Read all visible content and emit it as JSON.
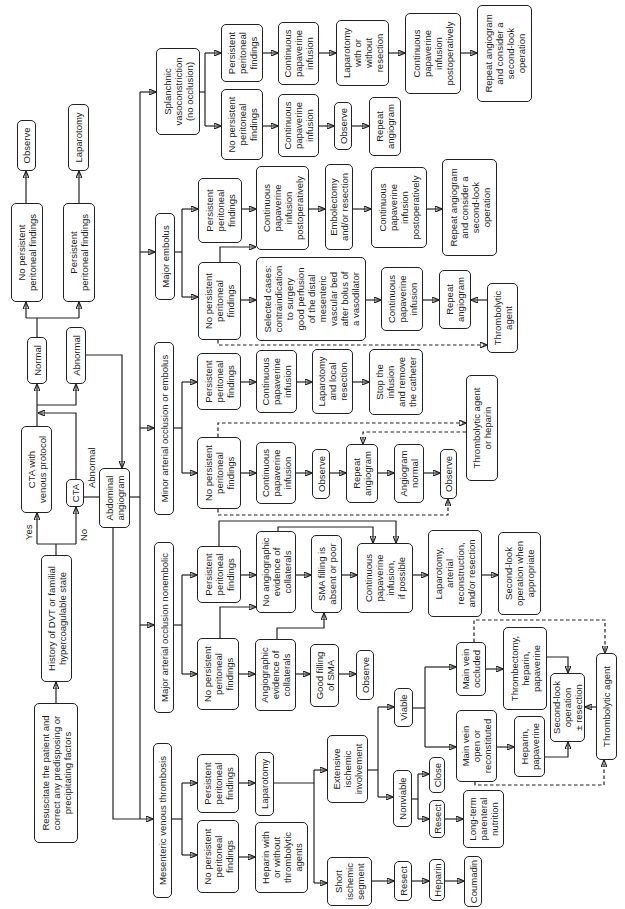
{
  "labels": {
    "yes": "Yes",
    "no": "No",
    "abnormal": "Abnormal"
  },
  "nodes": {
    "resuscitate": "Resuscitate the patient and\ncorrect any predisposing or\nprecipitating factors",
    "history": "History of DVT or familial\nhypercoagulable state",
    "cta_venous": "CTA  with\nvenous protocol",
    "cta": "CTA",
    "abd_angio": "Abdominal\nangiogram",
    "normal": "Normal",
    "abnormal": "Abnormal",
    "np_top": "No persistent\nperitoneal findings",
    "p_top": "Persistent\nperitoneal findings",
    "observe_top": "Observe",
    "laparotomy_top": "Laparotomy",
    "mvt": "Mesenteric venous thrombosis",
    "major_ne": "Major arterial occlusion nonembolic",
    "minor": "Minor arterial occlusion or embolus",
    "major_emb": "Major embolus",
    "splanchnic": "Splanchnic\nvasoconstriction\n(no occlusion)",
    "mvt_np": "No persistent\nperitoneal\nfindings",
    "mvt_p": "Persistent\nperitoneal\nfindings",
    "mvt_heparin": "Heparin with\nor without\nthrombolytic\nagents",
    "mvt_lap": "Laparotom y",
    "mvt_extensive": "Extensive\nischemic\ninvolvement",
    "mvt_short": "Short\nischemic\nsegment",
    "viable": "Viable",
    "nonviable": "Nonviable",
    "mv_occluded": "Main vein\noccluded",
    "mv_open": "Main vein\nopen or\nreconstituted",
    "thrombectomy": "Thrombectomy,\nheparin,\npapaverine",
    "heparin_pap": "Heparin,\npapaverine",
    "second_look_mvt": "Second-look\noperation\n± resection",
    "thrombolytic_mvt": "Thrombolytic agent",
    "close": "Close",
    "resect_nv": "Resect",
    "ltpn": "Long-term\nparenteral\nnutrition",
    "resect_short": "Resect",
    "heparin_short": "Heparin",
    "coumadin": "Coumadin",
    "mne_np": "No persistent\nperitoneal\nfindings",
    "mne_p": "Persistent\nperitoneal\nfindings",
    "mne_coll": "Angiographic\nevidence of\ncollaterals",
    "mne_good_sma": "Good filling\nof SMA",
    "mne_observe": "Observe",
    "mne_no_coll": "No angiographic\nevidence of\ncollaterals",
    "mne_sma_poor": "SMA filling is\nabsent or poor",
    "mne_cpi": "Continuous\npapaverine\ninfusion,\nif possible",
    "mne_lap": "Laparotomy,\narterial\nreconstruction,\nand/or resection",
    "mne_second_look": "Second-look\noperation when\nappropriate",
    "min_np": "No persistent\nperitoneal\nfindings",
    "min_p": "Persistent\nperitoneal\nfindings",
    "min_np_cpi": "Continuous\npapaverine\ninfusion",
    "min_np_observe": "Observe",
    "min_np_repeat": "Repeat\nangiogram",
    "min_np_normal": "Angiogram\nnormal",
    "min_np_observe2": "Observe",
    "min_thrombolytic": "Thrombolytic agent\nor heparin",
    "min_p_cpi": "Continuous\npapaverine\ninfusion",
    "min_p_lap": "Laparotomy\nand local\nresection",
    "min_p_stop": "Stop the\ninfusion\nand remove\nthe catheter",
    "emb_np": "No persistent\nperitoneal\nfindings",
    "emb_p": "Persistent\nperitoneal\nfindings",
    "emb_np_selected": "Selected cases:\ncontraindication\nto surgery\ngood perfusion\nof the distal\nmesenteric\nvascular bed\nafter bolus of\na vasodilator",
    "emb_np_cpi": "Continuous\npapaverine\ninfusion",
    "emb_np_repeat": "Repeat\nangiogram",
    "emb_np_thrombolytic": "Thrombolytic\nagent",
    "emb_p_cpi_postop": "Continuous\npapaverine\ninfusion\npostoperatively",
    "emb_p_embolectomy": "Embolectomy\nand/or resection",
    "emb_p_cpi_postop2": "Continuous\npapaverine\ninfusion\npostoperatively",
    "emb_p_repeat": "Repeat angiogram\nand consider a\nsecond-look\noperation",
    "spl_np": "No persistent\nperitoneal\nfindings",
    "spl_p": "Persistent\nperitoneal\nfindings",
    "spl_np_cpi": "Continuous\npapaverine\ninfusion",
    "spl_np_observe": "Observe",
    "spl_np_repeat": "Repeat\nangiogram",
    "spl_p_cpi": "Continuous\npapaverine\ninfusion",
    "spl_p_lap": "Laparotomy\nwith or\nwithout\nresection",
    "spl_p_cpi_postop": "Continuous\npapaverine\ninfusion\npostoperatively",
    "spl_p_repeat": "Repeat angiogram\nand consider a\nsecond-look\noperation"
  },
  "edges": [
    [
      "resuscitate",
      "history",
      "solid"
    ],
    [
      "history",
      "cta_venous",
      "solid",
      "Yes"
    ],
    [
      "history",
      "cta",
      "solid",
      "No"
    ],
    [
      "cta_venous",
      "normal",
      "solid"
    ],
    [
      "cta_venous",
      "abnormal",
      "solid"
    ],
    [
      "cta",
      "normal",
      "solid"
    ],
    [
      "cta",
      "abnormal",
      "solid"
    ],
    [
      "cta",
      "abd_angio",
      "solid",
      "Abnormal"
    ],
    [
      "abnormal",
      "abd_angio",
      "solid"
    ],
    [
      "normal",
      "np_top",
      "solid"
    ],
    [
      "normal",
      "p_top",
      "solid"
    ],
    [
      "np_top",
      "observe_top",
      "solid"
    ],
    [
      "p_top",
      "laparotomy_top",
      "solid"
    ],
    [
      "abd_angio",
      "mvt",
      "solid"
    ],
    [
      "abd_angio",
      "major_ne",
      "solid"
    ],
    [
      "abd_angio",
      "minor",
      "solid"
    ],
    [
      "abd_angio",
      "major_emb",
      "solid"
    ],
    [
      "abd_angio",
      "splanchnic",
      "solid"
    ],
    [
      "mvt",
      "mvt_np",
      "solid"
    ],
    [
      "mvt",
      "mvt_p",
      "solid"
    ],
    [
      "mvt_np",
      "mvt_heparin",
      "solid"
    ],
    [
      "mvt_p",
      "mvt_lap",
      "solid"
    ],
    [
      "mvt_lap",
      "mvt_extensive",
      "solid"
    ],
    [
      "mvt_lap",
      "mvt_short",
      "solid"
    ],
    [
      "mvt_extensive",
      "viable",
      "solid"
    ],
    [
      "mvt_extensive",
      "nonviable",
      "solid"
    ],
    [
      "viable",
      "mv_occluded",
      "solid"
    ],
    [
      "viable",
      "mv_open",
      "solid"
    ],
    [
      "mv_occluded",
      "thrombectomy",
      "solid"
    ],
    [
      "mv_open",
      "heparin_pap",
      "solid"
    ],
    [
      "thrombectomy",
      "second_look_mvt",
      "solid"
    ],
    [
      "heparin_pap",
      "second_look_mvt",
      "solid"
    ],
    [
      "thrombolytic_mvt",
      "second_look_mvt",
      "solid"
    ],
    [
      "mv_occluded",
      "thrombolytic_mvt",
      "dashed"
    ],
    [
      "mv_open",
      "thrombolytic_mvt",
      "dashed"
    ],
    [
      "nonviable",
      "close",
      "solid"
    ],
    [
      "nonviable",
      "resect_nv",
      "solid"
    ],
    [
      "resect_nv",
      "ltpn",
      "solid"
    ],
    [
      "mvt_short",
      "resect_short",
      "solid"
    ],
    [
      "resect_short",
      "heparin_short",
      "solid"
    ],
    [
      "heparin_short",
      "coumadin",
      "solid"
    ],
    [
      "major_ne",
      "mne_np",
      "solid"
    ],
    [
      "major_ne",
      "mne_p",
      "solid"
    ],
    [
      "mne_np",
      "mne_coll",
      "solid"
    ],
    [
      "mne_np",
      "mne_no_coll",
      "solid"
    ],
    [
      "mne_coll",
      "mne_good_sma",
      "solid"
    ],
    [
      "mne_coll",
      "mne_sma_poor",
      "solid"
    ],
    [
      "mne_good_sma",
      "mne_observe",
      "solid"
    ],
    [
      "mne_p",
      "mne_no_coll",
      "solid"
    ],
    [
      "mne_p",
      "mne_cpi",
      "solid"
    ],
    [
      "mne_no_coll",
      "mne_sma_poor",
      "solid"
    ],
    [
      "mne_no_coll",
      "mne_cpi",
      "solid"
    ],
    [
      "mne_sma_poor",
      "mne_cpi",
      "solid"
    ],
    [
      "mne_cpi",
      "mne_lap",
      "solid"
    ],
    [
      "mne_lap",
      "mne_second_look",
      "solid"
    ],
    [
      "minor",
      "min_np",
      "solid"
    ],
    [
      "minor",
      "min_p",
      "solid"
    ],
    [
      "min_np",
      "min_np_cpi",
      "solid"
    ],
    [
      "min_np_cpi",
      "min_np_observe",
      "solid"
    ],
    [
      "min_np_observe",
      "min_np_repeat",
      "solid"
    ],
    [
      "min_np_repeat",
      "min_np_normal",
      "solid"
    ],
    [
      "min_np_normal",
      "min_np_observe2",
      "solid"
    ],
    [
      "min_np",
      "min_thrombolytic",
      "dashed"
    ],
    [
      "min_thrombolytic",
      "min_np_repeat",
      "dashed"
    ],
    [
      "min_np",
      "min_np_observe2",
      "dashed"
    ],
    [
      "min_p",
      "min_p_cpi",
      "solid"
    ],
    [
      "min_p_cpi",
      "min_p_lap",
      "solid"
    ],
    [
      "min_p_lap",
      "min_p_stop",
      "solid"
    ],
    [
      "major_emb",
      "emb_np",
      "solid"
    ],
    [
      "major_emb",
      "emb_p",
      "solid"
    ],
    [
      "emb_p",
      "emb_p_cpi_postop",
      "solid"
    ],
    [
      "emb_np",
      "emb_p_cpi_postop",
      "solid"
    ],
    [
      "emb_p_cpi_postop",
      "emb_p_embolectomy",
      "solid"
    ],
    [
      "emb_p_embolectomy",
      "emb_p_cpi_postop2",
      "solid"
    ],
    [
      "emb_p_cpi_postop2",
      "emb_p_repeat",
      "solid"
    ],
    [
      "emb_np",
      "emb_np_selected",
      "solid"
    ],
    [
      "emb_np_selected",
      "emb_np_cpi",
      "solid"
    ],
    [
      "emb_np_cpi",
      "emb_np_repeat",
      "solid"
    ],
    [
      "emb_np_thrombolytic",
      "emb_np_repeat",
      "solid"
    ],
    [
      "emb_np",
      "emb_np_thrombolytic",
      "dashed"
    ],
    [
      "splanchnic",
      "spl_np",
      "solid"
    ],
    [
      "splanchnic",
      "spl_p",
      "solid"
    ],
    [
      "spl_np",
      "spl_np_cpi",
      "solid"
    ],
    [
      "spl_np_cpi",
      "spl_np_observe",
      "solid"
    ],
    [
      "spl_np_observe",
      "spl_np_repeat",
      "solid"
    ],
    [
      "spl_p",
      "spl_p_cpi",
      "solid"
    ],
    [
      "spl_p_cpi",
      "spl_p_lap",
      "solid"
    ],
    [
      "spl_p_lap",
      "spl_p_cpi_postop",
      "solid"
    ],
    [
      "spl_p_cpi_postop",
      "spl_p_repeat",
      "solid"
    ]
  ]
}
